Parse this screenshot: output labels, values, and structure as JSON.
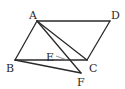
{
  "diagram": {
    "type": "geometry-figure",
    "shape": "parallelogram ABCD",
    "points": {
      "A": {
        "label": "A",
        "x": 37,
        "y": 21
      },
      "B": {
        "label": "B",
        "x": 15,
        "y": 60
      },
      "C": {
        "label": "C",
        "x": 87,
        "y": 60
      },
      "D": {
        "label": "D",
        "x": 110,
        "y": 21
      },
      "F": {
        "label": "F",
        "x": 81,
        "y": 73
      },
      "E": {
        "label": "E",
        "x": 67,
        "y": 60
      }
    },
    "segments": [
      "AB",
      "BC",
      "CD",
      "DA",
      "AC",
      "AF",
      "BF"
    ],
    "labels": {
      "A": "A",
      "B": "B",
      "C": "C",
      "D": "D",
      "E": "E",
      "F": "F"
    }
  }
}
